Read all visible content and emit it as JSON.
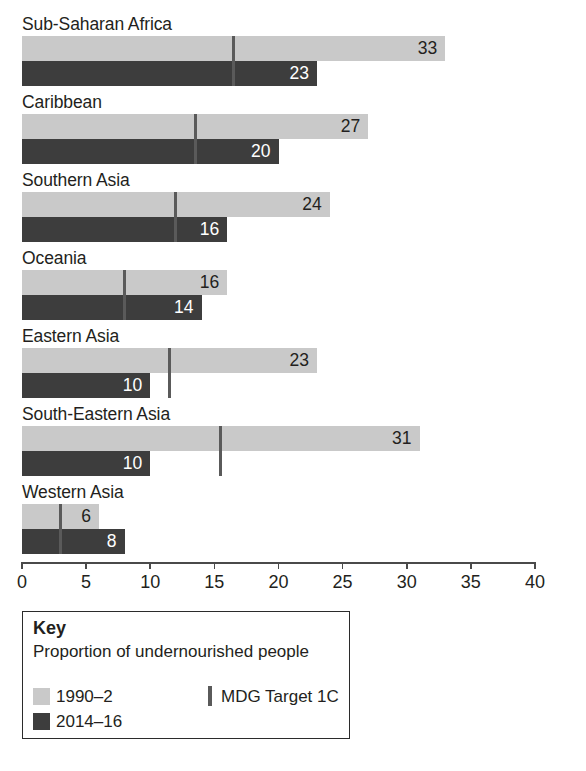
{
  "chart_data": {
    "type": "bar",
    "orientation": "horizontal",
    "title": "",
    "xlabel": "",
    "ylabel": "",
    "xlim": [
      0,
      40
    ],
    "xticks": [
      0,
      5,
      10,
      15,
      20,
      25,
      30,
      35,
      40
    ],
    "xtick_labels": [
      "0",
      "5",
      "10",
      "15",
      "20",
      "25",
      "30",
      "35",
      "40"
    ],
    "grid": false,
    "legend_position": "below-axis-left",
    "categories": [
      "Sub-Saharan Africa",
      "Caribbean",
      "Southern Asia",
      "Oceania",
      "Eastern Asia",
      "South-Eastern Asia",
      "Western Asia"
    ],
    "series": [
      {
        "name": "1990–2",
        "color": "#c9c9c9",
        "values": [
          33,
          27,
          24,
          16,
          23,
          31,
          6
        ],
        "labels": [
          "33",
          "27",
          "24",
          "16",
          "23",
          "31",
          "6"
        ]
      },
      {
        "name": "2014–16",
        "color": "#3d3d3d",
        "values": [
          23,
          20,
          16,
          14,
          10,
          10,
          8
        ],
        "labels": [
          "23",
          "20",
          "16",
          "14",
          "10",
          "10",
          "8"
        ]
      }
    ],
    "markers": {
      "name": "MDG Target 1C",
      "color": "#5a5a5a",
      "values": [
        16.5,
        13.5,
        12,
        8,
        11.5,
        15.5,
        3
      ]
    }
  },
  "key": {
    "title": "Key",
    "description": "Proportion of undernourished people",
    "series_1_label": "1990–2",
    "series_2_label": "2014–16",
    "marker_label": "MDG Target 1C"
  },
  "colors": {
    "series_1990": "#c9c9c9",
    "series_2014": "#3d3d3d",
    "marker": "#5a5a5a",
    "axis": "#4a4a4a",
    "text": "#231f20",
    "background": "#ffffff"
  }
}
